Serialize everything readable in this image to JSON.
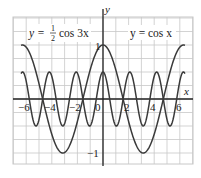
{
  "chart_data": {
    "type": "line",
    "title": "",
    "xlabel": "x",
    "ylabel": "y",
    "xlim": [
      -7,
      7
    ],
    "ylim": [
      -1.2,
      1.5
    ],
    "grid": true,
    "x_ticks": [
      -6,
      -4,
      -2,
      0,
      2,
      4,
      6
    ],
    "x_tick_labels": [
      "−6",
      "−4",
      "−2",
      "0",
      "2",
      "4",
      "6"
    ],
    "y_ticks": [
      1,
      -1
    ],
    "y_tick_labels": [
      "1",
      "−1"
    ],
    "series": [
      {
        "name": "y = cos x",
        "function": "cos(x)",
        "amplitude": 1,
        "frequency": 1,
        "domain": [
          -6.4,
          6.4
        ]
      },
      {
        "name": "y = 1/2 cos 3x",
        "function": "0.5*cos(3x)",
        "amplitude": 0.5,
        "frequency": 3,
        "domain": [
          -6.4,
          6.4
        ]
      }
    ],
    "annotations": [
      {
        "text": "y = ½ cos 3x",
        "position": "upper-left"
      },
      {
        "text": "y = cos x",
        "position": "upper-right"
      }
    ]
  },
  "labels": {
    "x_axis": "x",
    "y_axis": "y",
    "eq1_prefix": "y = ",
    "eq1_num": "1",
    "eq1_den": "2",
    "eq1_suffix": "cos 3x",
    "eq2": "y = cos x",
    "tick_x": [
      "−6",
      "−4",
      "−2",
      "0",
      "2",
      "4",
      "6"
    ],
    "tick_y_pos": "1",
    "tick_y_neg": "−1"
  },
  "colors": {
    "curve": "#3a3a3a",
    "grid": "#c8c8c8",
    "axis": "#222222"
  }
}
